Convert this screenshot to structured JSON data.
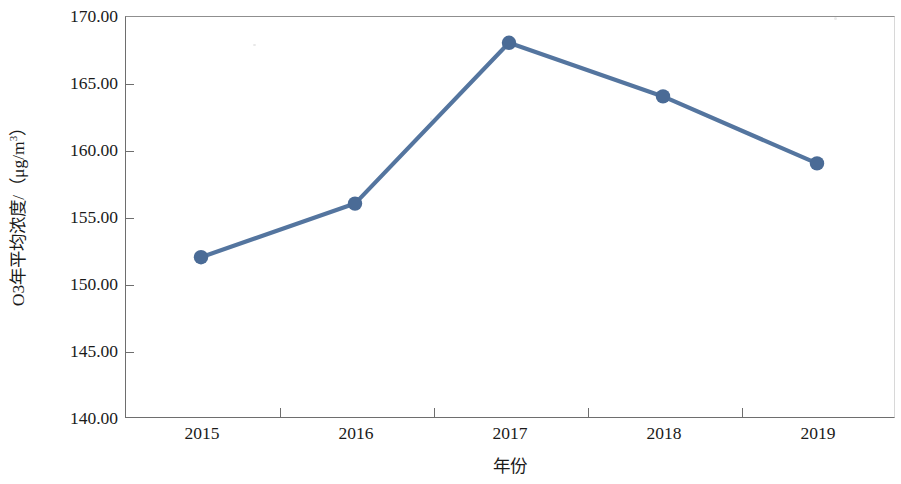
{
  "chart_data": {
    "type": "line",
    "title": "",
    "categories": [
      "2015",
      "2016",
      "2017",
      "2018",
      "2019"
    ],
    "values": [
      152,
      156,
      168,
      164,
      159
    ],
    "series": [
      {
        "name": "O3年平均浓度",
        "values": [
          152,
          156,
          168,
          164,
          159
        ]
      }
    ],
    "xlabel": "年份",
    "ylabel": "O3年平均浓度/（μg/m³）",
    "ylim": [
      140,
      170
    ],
    "ytick_values": [
      140,
      145,
      150,
      155,
      160,
      165,
      170
    ],
    "ytick_labels": [
      "140.00",
      "145.00",
      "150.00",
      "155.00",
      "160.00",
      "165.00",
      "170.00"
    ],
    "xtick_labels": [
      "2015",
      "2016",
      "2017",
      "2018",
      "2019"
    ],
    "grid": false,
    "legend": null,
    "legend_position": "none",
    "marker": "circle",
    "line_color": "#54759F",
    "marker_color": "#4A6B96",
    "axis_color": "#6E6E6E",
    "background_color": "#FFFFFF",
    "units": "μg/m³"
  },
  "axes": {
    "y_title_prefix": "O3年平均浓度/（μg/m",
    "y_title_exponent": "3",
    "y_title_suffix": "）",
    "x_title": "年份"
  }
}
